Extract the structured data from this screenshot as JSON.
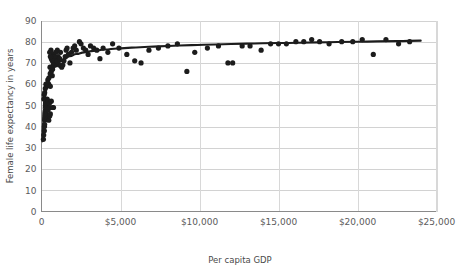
{
  "chart_data": {
    "type": "scatter",
    "title": "",
    "xlabel": "Per capita GDP",
    "ylabel": "Female life expectancy in years",
    "xlim": [
      0,
      25000
    ],
    "ylim": [
      0,
      90
    ],
    "grid": true,
    "legend": null,
    "xticks": [
      0,
      5000,
      10000,
      15000,
      20000,
      25000
    ],
    "xtick_labels": [
      "0",
      "$5,000",
      "$10,000",
      "$15,000",
      "$20,000",
      "$25,000"
    ],
    "yticks": [
      0,
      10,
      20,
      30,
      40,
      50,
      60,
      70,
      80,
      90
    ],
    "ytick_labels": [
      "0",
      "10",
      "20",
      "30",
      "40",
      "50",
      "60",
      "70",
      "80",
      "90"
    ],
    "series": [
      {
        "name": "countries",
        "marker": "circle",
        "color": "#1c1c1c",
        "points": [
          [
            120,
            34
          ],
          [
            140,
            36
          ],
          [
            180,
            38
          ],
          [
            190,
            40
          ],
          [
            200,
            41
          ],
          [
            210,
            43
          ],
          [
            230,
            44
          ],
          [
            250,
            45
          ],
          [
            260,
            46
          ],
          [
            280,
            47
          ],
          [
            300,
            48
          ],
          [
            310,
            50
          ],
          [
            330,
            51
          ],
          [
            350,
            52
          ],
          [
            360,
            53
          ],
          [
            150,
            53
          ],
          [
            170,
            55
          ],
          [
            200,
            56
          ],
          [
            240,
            58
          ],
          [
            280,
            60
          ],
          [
            330,
            49
          ],
          [
            420,
            48
          ],
          [
            520,
            49
          ],
          [
            700,
            49
          ],
          [
            760,
            49
          ],
          [
            430,
            44
          ],
          [
            460,
            43
          ],
          [
            520,
            45
          ],
          [
            560,
            46
          ],
          [
            420,
            52
          ],
          [
            500,
            51
          ],
          [
            620,
            52
          ],
          [
            330,
            59
          ],
          [
            460,
            60
          ],
          [
            560,
            59
          ],
          [
            680,
            64
          ],
          [
            400,
            62
          ],
          [
            470,
            63
          ],
          [
            550,
            65
          ],
          [
            620,
            66
          ],
          [
            540,
            68
          ],
          [
            700,
            67
          ],
          [
            780,
            70
          ],
          [
            860,
            69
          ],
          [
            900,
            72
          ],
          [
            980,
            71
          ],
          [
            1050,
            73
          ],
          [
            1120,
            69
          ],
          [
            760,
            74
          ],
          [
            820,
            73
          ],
          [
            900,
            75
          ],
          [
            1000,
            76
          ],
          [
            620,
            72
          ],
          [
            680,
            71
          ],
          [
            740,
            69
          ],
          [
            560,
            73
          ],
          [
            520,
            75
          ],
          [
            600,
            76
          ],
          [
            1150,
            72
          ],
          [
            1200,
            75
          ],
          [
            1280,
            68
          ],
          [
            1350,
            69
          ],
          [
            1420,
            71
          ],
          [
            1500,
            73
          ],
          [
            1560,
            76
          ],
          [
            1620,
            77
          ],
          [
            1700,
            74
          ],
          [
            1800,
            70
          ],
          [
            1900,
            75
          ],
          [
            2000,
            77
          ],
          [
            2100,
            78
          ],
          [
            2200,
            76
          ],
          [
            2400,
            80
          ],
          [
            2500,
            79
          ],
          [
            2650,
            77
          ],
          [
            2800,
            76
          ],
          [
            2950,
            74
          ],
          [
            3100,
            78
          ],
          [
            3300,
            77
          ],
          [
            3500,
            76
          ],
          [
            3700,
            72
          ],
          [
            3900,
            77
          ],
          [
            4200,
            75
          ],
          [
            4500,
            79
          ],
          [
            4900,
            77
          ],
          [
            5400,
            74
          ],
          [
            5900,
            71
          ],
          [
            6300,
            70
          ],
          [
            6800,
            76
          ],
          [
            7400,
            77
          ],
          [
            8000,
            78
          ],
          [
            8600,
            79
          ],
          [
            9200,
            66
          ],
          [
            9700,
            75
          ],
          [
            10500,
            77
          ],
          [
            11200,
            78
          ],
          [
            11800,
            70
          ],
          [
            12100,
            70
          ],
          [
            12700,
            78
          ],
          [
            13200,
            78
          ],
          [
            13900,
            76
          ],
          [
            14500,
            79
          ],
          [
            15000,
            79
          ],
          [
            15500,
            79
          ],
          [
            16100,
            80
          ],
          [
            16600,
            80
          ],
          [
            17100,
            81
          ],
          [
            17600,
            80
          ],
          [
            18200,
            79
          ],
          [
            19000,
            80
          ],
          [
            19700,
            80
          ],
          [
            20300,
            81
          ],
          [
            21000,
            74
          ],
          [
            21800,
            81
          ],
          [
            22600,
            79
          ],
          [
            23300,
            80
          ]
        ]
      }
    ],
    "trend": {
      "kind": "logarithmic",
      "color": "#1c1c1c",
      "points": [
        [
          60,
          33
        ],
        [
          90,
          42
        ],
        [
          130,
          48
        ],
        [
          180,
          53
        ],
        [
          240,
          56
        ],
        [
          320,
          59
        ],
        [
          420,
          62
        ],
        [
          560,
          65
        ],
        [
          720,
          67
        ],
        [
          900,
          69
        ],
        [
          1150,
          70.5
        ],
        [
          1450,
          72
        ],
        [
          1800,
          73.2
        ],
        [
          2200,
          74.2
        ],
        [
          2700,
          75.0
        ],
        [
          3300,
          75.7
        ],
        [
          4000,
          76.3
        ],
        [
          4800,
          76.8
        ],
        [
          5700,
          77.2
        ],
        [
          6800,
          77.6
        ],
        [
          8000,
          78.0
        ],
        [
          9500,
          78.4
        ],
        [
          11000,
          78.7
        ],
        [
          13000,
          79.1
        ],
        [
          15000,
          79.4
        ],
        [
          17500,
          79.7
        ],
        [
          20000,
          80.0
        ],
        [
          22500,
          80.3
        ],
        [
          24000,
          80.5
        ]
      ]
    }
  },
  "axes": {
    "y_title": "Female life expectancy in years",
    "x_title": "Per capita GDP"
  }
}
